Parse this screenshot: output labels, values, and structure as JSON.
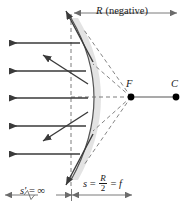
{
  "figure": {
    "background": "#ffffff",
    "width": 190,
    "height": 208
  },
  "labels": {
    "radius": {
      "symbol": "R",
      "qualifier": "(negative)",
      "text": "R (negative)"
    },
    "focal_point": "F",
    "center_of_curvature": "C",
    "object_distance": {
      "lhs": "s",
      "eq1": "=",
      "numerator": "R",
      "denominator": "2",
      "eq2": "=",
      "rhs": "f",
      "text": "s = R/2 = f"
    },
    "image_distance": {
      "symbol": "s'",
      "eq": "=",
      "value": "∞",
      "text": "s' = ∞"
    }
  },
  "colors": {
    "ray": "#3a3a3a",
    "mirror_curve": "#555555",
    "mirror_shade": "#e2e2e2",
    "dashed": "#6e6e6e",
    "axis": "#555555",
    "dot": "#000000",
    "dimension": "#6b6b6b",
    "text": "#1a1a1a"
  },
  "geometry": {
    "vertex_x": 71,
    "axis_y": 97,
    "focal_point_x": 131,
    "center_x": 176,
    "mirror_top_y": 18,
    "mirror_bottom_y": 180,
    "incoming_ray_y": [
      43,
      71,
      98,
      126,
      154
    ],
    "radius_dimension": {
      "x_start": 74,
      "x_end": 177,
      "y": 13
    },
    "focal_dimension": {
      "x_start": 72,
      "x_end": 132,
      "y": 195
    },
    "image_dimension": {
      "x_start": 4,
      "x_end": 72,
      "y": 195
    }
  },
  "elements": {
    "incoming_rays_count": 5,
    "reflected_rays_count": 5,
    "virtual_extension_count": 5,
    "mirror_type": "convex",
    "mirror_bulge_direction": "left"
  }
}
